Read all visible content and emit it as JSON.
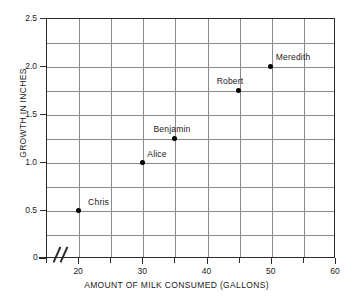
{
  "chart_data": {
    "type": "scatter",
    "title": "",
    "xlabel": "AMOUNT OF MILK CONSUMED (GALLONS)",
    "ylabel": "GROWTH IN INCHES",
    "xlim": [
      15,
      60
    ],
    "ylim": [
      0,
      2.5
    ],
    "x_axis_break": true,
    "zero_label": "0",
    "grid": true,
    "x_gridline_step": 5,
    "y_gridline_step": 0.25,
    "xticks": [
      20,
      30,
      40,
      50,
      60
    ],
    "xtick_labels": [
      "20",
      "30",
      "40",
      "50",
      "60"
    ],
    "yticks": [
      0.5,
      1.0,
      1.5,
      2.0,
      2.5
    ],
    "ytick_labels": [
      "0.5",
      "1.0",
      "1.5",
      "2.0",
      "2.5"
    ],
    "points": [
      {
        "label": "Chris",
        "x": 20,
        "y": 0.5,
        "label_dx": 10,
        "label_dy": -13
      },
      {
        "label": "Alice",
        "x": 30,
        "y": 1.0,
        "label_dx": 5,
        "label_dy": -13
      },
      {
        "label": "Benjamin",
        "x": 35,
        "y": 1.25,
        "label_dx": -21,
        "label_dy": -14
      },
      {
        "label": "Robert",
        "x": 45,
        "y": 1.75,
        "label_dx": -22,
        "label_dy": -14
      },
      {
        "label": "Meredith",
        "x": 50,
        "y": 2.0,
        "label_dx": 5,
        "label_dy": -14
      }
    ]
  }
}
